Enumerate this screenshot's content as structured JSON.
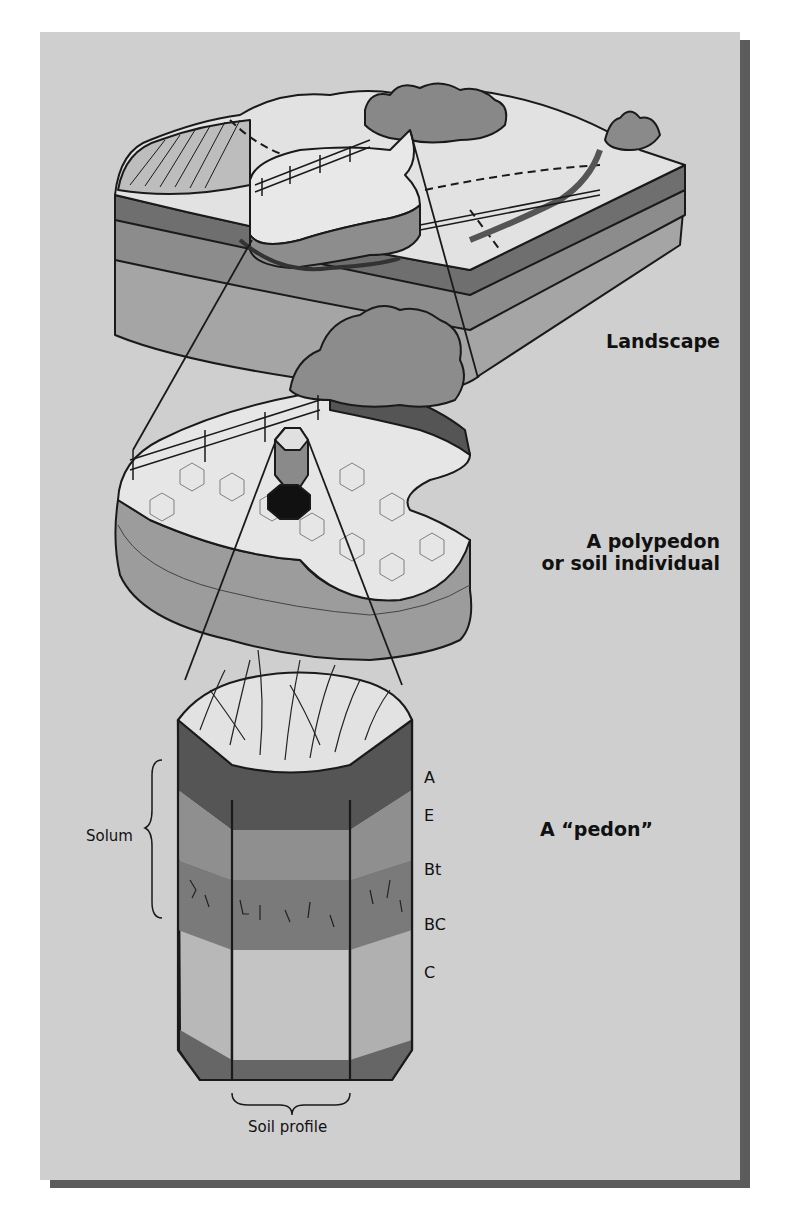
{
  "figure": {
    "colors": {
      "background": "#cfcfcf",
      "shadow": "#5c5c5c",
      "soil_dark": "#6f6f6f",
      "soil_mid": "#9a9a9a",
      "soil_light": "#b5b5b5",
      "surface": "#e4e4e4",
      "outline": "#1a1a1a"
    }
  },
  "labels": {
    "landscape": "Landscape",
    "polypedon_line1": "A polypedon",
    "polypedon_line2": "or soil individual",
    "pedon": "A “pedon”",
    "solum": "Solum",
    "soil_profile": "Soil profile"
  },
  "horizons": [
    {
      "name": "A"
    },
    {
      "name": "E"
    },
    {
      "name": "Bt"
    },
    {
      "name": "BC"
    },
    {
      "name": "C"
    }
  ]
}
